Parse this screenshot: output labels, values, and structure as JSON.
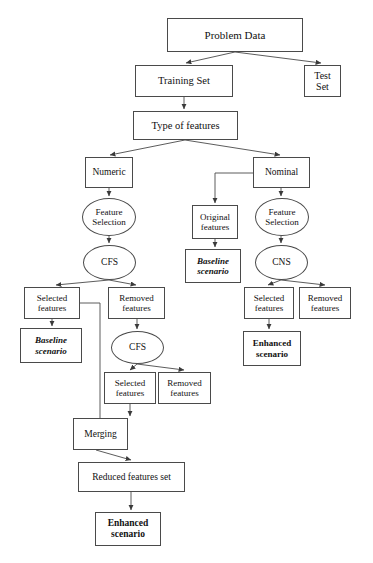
{
  "diagram": {
    "type": "flowchart",
    "stroke_color": "#4a4a4a",
    "text_color": "#111111",
    "background": "#ffffff",
    "nodes": [
      {
        "id": "problem_data",
        "label": "Problem Data",
        "shape": "box",
        "style": "normal",
        "x": 167,
        "y": 18,
        "w": 136,
        "h": 34,
        "font": 11
      },
      {
        "id": "training_set",
        "label": "Training Set",
        "shape": "box",
        "style": "normal",
        "x": 135,
        "y": 65,
        "w": 98,
        "h": 32,
        "font": 10.5
      },
      {
        "id": "test_set",
        "label": "Test\nSet",
        "shape": "box",
        "style": "normal",
        "x": 304,
        "y": 65,
        "w": 37,
        "h": 32,
        "font": 10
      },
      {
        "id": "type_of_features",
        "label": "Type of features",
        "shape": "box",
        "style": "normal",
        "x": 133,
        "y": 111,
        "w": 105,
        "h": 29,
        "font": 10.5
      },
      {
        "id": "numeric",
        "label": "Numeric",
        "shape": "box",
        "style": "normal",
        "x": 85,
        "y": 157,
        "w": 48,
        "h": 31,
        "font": 9.5
      },
      {
        "id": "nominal",
        "label": "Nominal",
        "shape": "box",
        "style": "normal",
        "x": 253,
        "y": 157,
        "w": 57,
        "h": 31,
        "font": 9.5
      },
      {
        "id": "fs_numeric",
        "label": "Feature\nSelection",
        "shape": "ellipse",
        "style": "normal",
        "x": 82,
        "y": 198,
        "w": 54,
        "h": 38,
        "font": 9
      },
      {
        "id": "original_features",
        "label": "Original\nfeatures",
        "shape": "box",
        "style": "normal",
        "x": 192,
        "y": 205,
        "w": 46,
        "h": 34,
        "font": 9
      },
      {
        "id": "fs_nominal",
        "label": "Feature\nSelection",
        "shape": "ellipse",
        "style": "normal",
        "x": 255,
        "y": 198,
        "w": 54,
        "h": 38,
        "font": 9
      },
      {
        "id": "cfs_1",
        "label": "CFS",
        "shape": "ellipse",
        "style": "normal",
        "x": 83,
        "y": 245,
        "w": 53,
        "h": 35,
        "font": 9.5
      },
      {
        "id": "baseline_nominal",
        "label": "Baseline\nscenario",
        "shape": "box",
        "style": "bolditalic",
        "x": 185,
        "y": 249,
        "w": 56,
        "h": 34,
        "font": 9
      },
      {
        "id": "cns",
        "label": "CNS",
        "shape": "ellipse",
        "style": "normal",
        "x": 255,
        "y": 245,
        "w": 53,
        "h": 35,
        "font": 9.5
      },
      {
        "id": "sel_feat_cfs1",
        "label": "Selected\nfeatures",
        "shape": "box",
        "style": "normal",
        "x": 24,
        "y": 287,
        "w": 56,
        "h": 32,
        "font": 9
      },
      {
        "id": "rem_feat_cfs1",
        "label": "Removed\nfeatures",
        "shape": "box",
        "style": "normal",
        "x": 108,
        "y": 287,
        "w": 57,
        "h": 32,
        "font": 9
      },
      {
        "id": "sel_feat_cns",
        "label": "Selected\nfeatures",
        "shape": "box",
        "style": "normal",
        "x": 244,
        "y": 287,
        "w": 50,
        "h": 32,
        "font": 9
      },
      {
        "id": "rem_feat_cns",
        "label": "Removed\nfeatures",
        "shape": "box",
        "style": "normal",
        "x": 299,
        "y": 287,
        "w": 52,
        "h": 32,
        "font": 9
      },
      {
        "id": "baseline_numeric",
        "label": "Baseline\nscenario",
        "shape": "box",
        "style": "bolditalic",
        "x": 20,
        "y": 328,
        "w": 62,
        "h": 35,
        "font": 9
      },
      {
        "id": "cfs_2",
        "label": "CFS",
        "shape": "ellipse",
        "style": "normal",
        "x": 111,
        "y": 331,
        "w": 53,
        "h": 33,
        "font": 9.5
      },
      {
        "id": "enhanced_nominal",
        "label": "Enhanced\nscenario",
        "shape": "box",
        "style": "bold",
        "x": 243,
        "y": 331,
        "w": 58,
        "h": 35,
        "font": 9
      },
      {
        "id": "sel_feat_cfs2",
        "label": "Selected\nfeatures",
        "shape": "box",
        "style": "normal",
        "x": 104,
        "y": 372,
        "w": 52,
        "h": 32,
        "font": 9
      },
      {
        "id": "rem_feat_cfs2",
        "label": "Removed\nfeatures",
        "shape": "box",
        "style": "normal",
        "x": 158,
        "y": 372,
        "w": 53,
        "h": 32,
        "font": 9
      },
      {
        "id": "merging",
        "label": "Merging",
        "shape": "box",
        "style": "normal",
        "x": 73,
        "y": 418,
        "w": 55,
        "h": 32,
        "font": 9.5
      },
      {
        "id": "reduced_features",
        "label": "Reduced features set",
        "shape": "box",
        "style": "normal",
        "x": 78,
        "y": 462,
        "w": 107,
        "h": 30,
        "font": 9.5
      },
      {
        "id": "enhanced_numeric",
        "label": "Enhanced\nscenario",
        "shape": "box",
        "style": "bold",
        "x": 95,
        "y": 512,
        "w": 66,
        "h": 34,
        "font": 9.5
      }
    ],
    "edges": [
      {
        "from": "problem_data",
        "to": "training_set",
        "kind": "diagonal"
      },
      {
        "from": "problem_data",
        "to": "test_set",
        "kind": "diagonal"
      },
      {
        "from": "training_set",
        "to": "type_of_features",
        "kind": "vertical"
      },
      {
        "from": "type_of_features",
        "to": "numeric",
        "kind": "diagonal"
      },
      {
        "from": "type_of_features",
        "to": "nominal",
        "kind": "diagonal"
      },
      {
        "from": "numeric",
        "to": "fs_numeric",
        "kind": "vertical"
      },
      {
        "from": "nominal",
        "to": "fs_nominal",
        "kind": "vertical"
      },
      {
        "from": "nominal",
        "to": "original_features",
        "kind": "elbow"
      },
      {
        "from": "fs_numeric",
        "to": "cfs_1",
        "kind": "vertical"
      },
      {
        "from": "fs_nominal",
        "to": "cns",
        "kind": "vertical"
      },
      {
        "from": "original_features",
        "to": "baseline_nominal",
        "kind": "vertical"
      },
      {
        "from": "cfs_1",
        "to": "sel_feat_cfs1",
        "kind": "diagonal"
      },
      {
        "from": "cfs_1",
        "to": "rem_feat_cfs1",
        "kind": "diagonal"
      },
      {
        "from": "cns",
        "to": "sel_feat_cns",
        "kind": "diagonal"
      },
      {
        "from": "cns",
        "to": "rem_feat_cns",
        "kind": "diagonal"
      },
      {
        "from": "sel_feat_cfs1",
        "to": "baseline_numeric",
        "kind": "vertical"
      },
      {
        "from": "rem_feat_cfs1",
        "to": "cfs_2",
        "kind": "vertical"
      },
      {
        "from": "sel_feat_cns",
        "to": "enhanced_nominal",
        "kind": "vertical"
      },
      {
        "from": "cfs_2",
        "to": "sel_feat_cfs2",
        "kind": "diagonal"
      },
      {
        "from": "cfs_2",
        "to": "rem_feat_cfs2",
        "kind": "diagonal"
      },
      {
        "from": "sel_feat_cfs1",
        "to": "merging",
        "kind": "elbow-right"
      },
      {
        "from": "sel_feat_cfs2",
        "to": "merging",
        "kind": "vertical"
      },
      {
        "from": "merging",
        "to": "reduced_features",
        "kind": "diagonal"
      },
      {
        "from": "reduced_features",
        "to": "enhanced_numeric",
        "kind": "vertical"
      }
    ]
  }
}
